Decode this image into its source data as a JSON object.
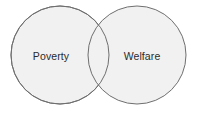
{
  "figure": {
    "type": "venn-diagram",
    "title": "",
    "caption": "",
    "background_color": "#ffffff",
    "width": 198,
    "height": 114
  },
  "chart_data": {
    "type": "venn",
    "title": "",
    "sets": [
      {
        "id": "left",
        "label": "Poverty",
        "cx": 60,
        "cy": 55,
        "r": 49,
        "fill": "#f1f1f1",
        "stroke": "#6f6f6f",
        "label_x": 51,
        "label_y": 57
      },
      {
        "id": "right",
        "label": "Welfare",
        "cx": 137,
        "cy": 55,
        "r": 49,
        "fill": "#f1f1f1",
        "stroke": "#6f6f6f",
        "label_x": 142,
        "label_y": 57
      }
    ],
    "intersection": {
      "label": "",
      "fill": "#f1f1f1",
      "shaded": false
    },
    "stroke_width": 1,
    "legend": null,
    "grid": false
  }
}
